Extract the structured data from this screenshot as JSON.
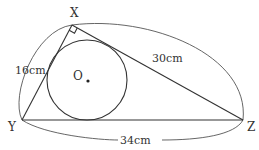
{
  "diagram": {
    "type": "right-triangle-with-incircle",
    "vertices": {
      "X": {
        "label": "X",
        "right_angle": true
      },
      "Y": {
        "label": "Y"
      },
      "Z": {
        "label": "Z"
      }
    },
    "center_label": "O",
    "sides": {
      "XY": {
        "label": "16cm",
        "length": 16,
        "unit": "cm"
      },
      "XZ": {
        "label": "30cm",
        "length": 30,
        "unit": "cm"
      },
      "YZ": {
        "label": "34cm",
        "length": 34,
        "unit": "cm"
      }
    }
  }
}
